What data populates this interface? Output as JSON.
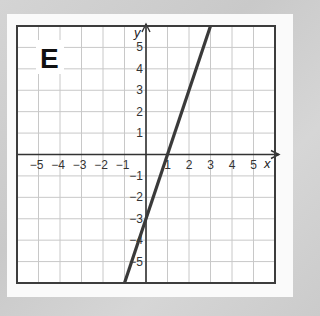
{
  "panel_label": "E",
  "chart_data": {
    "type": "line",
    "title": "E",
    "xlabel": "x",
    "ylabel": "y",
    "xlim": [
      -6,
      6
    ],
    "ylim": [
      -6,
      6
    ],
    "grid": true,
    "x_ticks": [
      -5,
      -4,
      -3,
      -2,
      -1,
      1,
      2,
      3,
      4,
      5
    ],
    "y_ticks": [
      -5,
      -4,
      -3,
      -2,
      -1,
      1,
      2,
      3,
      4,
      5
    ],
    "x_tick_labels": [
      "−5",
      "−4",
      "−3",
      "−2",
      "−1",
      "1",
      "2",
      "3",
      "4",
      "5"
    ],
    "y_tick_labels": [
      "−5",
      "−4",
      "−3",
      "−2",
      "−1",
      "1",
      "2",
      "3",
      "4",
      "5"
    ],
    "series": [
      {
        "name": "line",
        "equation": "y = 3x - 3",
        "slope": 3,
        "y_intercept": -3,
        "x_intercept": 1,
        "x": [
          -1,
          0,
          1,
          2,
          3
        ],
        "y": [
          -6,
          -3,
          0,
          3,
          6
        ],
        "color": "#3a3a3a"
      }
    ]
  },
  "colors": {
    "grid": "#c8c8c8",
    "axis": "#333333",
    "border": "#3c3c3c",
    "line": "#3a3a3a",
    "card": "#fafafa"
  }
}
